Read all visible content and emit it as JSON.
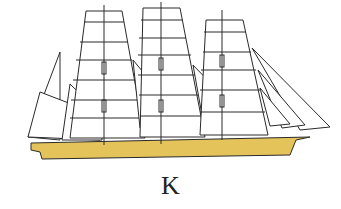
{
  "figure": {
    "label": "K",
    "colors": {
      "hull": "#e3c35a",
      "line": "#2a2a2a",
      "sail": "#ffffff",
      "background": "#ffffff"
    }
  }
}
